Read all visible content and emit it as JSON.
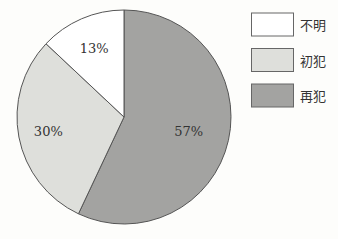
{
  "chart_data": {
    "type": "pie",
    "title": "",
    "slices": [
      {
        "label": "再犯",
        "value": 57,
        "display": "57%",
        "color": "#a3a3a1"
      },
      {
        "label": "初犯",
        "value": 30,
        "display": "30%",
        "color": "#dedfdb"
      },
      {
        "label": "不明",
        "value": 13,
        "display": "13%",
        "color": "#ffffff"
      }
    ],
    "start": "top, clockwise",
    "legend": {
      "placement": "top-right",
      "entries": [
        {
          "label": "不明",
          "color": "#ffffff"
        },
        {
          "label": "初犯",
          "color": "#dedfdb"
        },
        {
          "label": "再犯",
          "color": "#a3a3a1"
        }
      ]
    }
  }
}
